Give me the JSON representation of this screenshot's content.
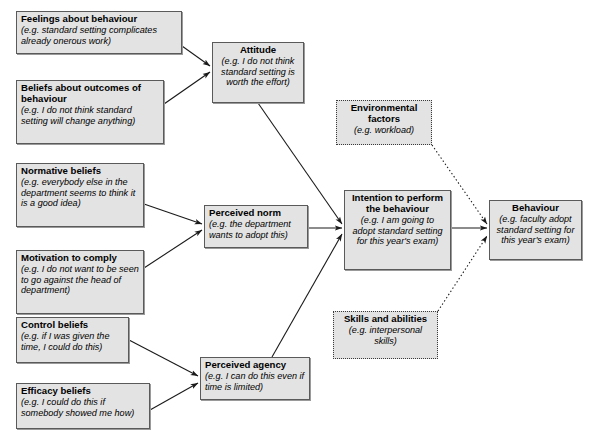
{
  "diagram": {
    "type": "flow-diagram",
    "background_color": "#ffffff",
    "node_fill_color": "#e3e3e3",
    "node_border_color": "#5a5a5a",
    "dotted_border_color": "#3a3a3a",
    "arrow_color": "#1a1a1a"
  },
  "nodes": [
    {
      "id": "feelings",
      "heading": "Feelings about behaviour",
      "example": "(e.g. standard setting complicates already onerous work)",
      "style": "solid",
      "align": "left",
      "x": 16,
      "y": 11,
      "w": 166,
      "h": 43
    },
    {
      "id": "beliefs_outcomes",
      "heading": "Beliefs about outcomes of behaviour",
      "example": "(e.g. I do not think standard setting will change anything)",
      "style": "solid",
      "align": "left",
      "x": 16,
      "y": 80,
      "w": 148,
      "h": 64
    },
    {
      "id": "normative",
      "heading": "Normative beliefs",
      "example": "(e.g. everybody else in the department seems to think it is a good idea)",
      "style": "solid",
      "align": "left",
      "x": 16,
      "y": 163,
      "w": 128,
      "h": 64
    },
    {
      "id": "motivation",
      "heading": "Motivation to comply",
      "example": "(e.g. I do not want to be seen to go against the head of department)",
      "style": "solid",
      "align": "left",
      "x": 16,
      "y": 250,
      "w": 128,
      "h": 64
    },
    {
      "id": "control",
      "heading": "Control beliefs",
      "example": "(e.g. if I was given the time, I could do this)",
      "style": "solid",
      "align": "left",
      "x": 16,
      "y": 317,
      "w": 113,
      "h": 46
    },
    {
      "id": "efficacy",
      "heading": "Efficacy beliefs",
      "example": "(e.g. I could do this if somebody showed me how)",
      "style": "solid",
      "align": "left",
      "x": 16,
      "y": 383,
      "w": 134,
      "h": 46
    },
    {
      "id": "attitude",
      "heading": "Attitude",
      "example": "(e.g. I do not think standard setting is worth the effort)",
      "style": "solid",
      "align": "center",
      "x": 212,
      "y": 42,
      "w": 92,
      "h": 61
    },
    {
      "id": "perceived_norm",
      "heading": "Perceived norm",
      "example": "(e.g. the department wants to adopt this)",
      "style": "solid",
      "align": "left",
      "x": 204,
      "y": 205,
      "w": 104,
      "h": 43
    },
    {
      "id": "perceived_agency",
      "heading": "Perceived agency",
      "example": "(e.g. I can do this even if time is limited)",
      "style": "solid",
      "align": "left",
      "x": 200,
      "y": 357,
      "w": 110,
      "h": 43
    },
    {
      "id": "environmental",
      "heading": "Environmental factors",
      "example": "(e.g. workload)",
      "style": "dotted",
      "align": "center",
      "x": 336,
      "y": 100,
      "w": 96,
      "h": 45
    },
    {
      "id": "skills",
      "heading": "Skills and abilities",
      "example": "(e.g. interpersonal skills)",
      "style": "dotted",
      "align": "center",
      "x": 333,
      "y": 311,
      "w": 105,
      "h": 48
    },
    {
      "id": "intention",
      "heading": "Intention to perform the behaviour",
      "example": "(e.g. I am going to adopt standard setting for this year's exam)",
      "style": "solid",
      "align": "center",
      "x": 344,
      "y": 190,
      "w": 107,
      "h": 80
    },
    {
      "id": "behaviour",
      "heading": "Behaviour",
      "example": "(e.g. faculty adopt standard setting for this year's exam)",
      "style": "solid",
      "align": "center",
      "x": 489,
      "y": 200,
      "w": 93,
      "h": 60
    }
  ],
  "edges": [
    {
      "id": "feelings-attitude",
      "from": "feelings",
      "to": "attitude",
      "style": "solid",
      "x1": 182,
      "y1": 46,
      "x2": 210,
      "y2": 66
    },
    {
      "id": "beliefs-attitude",
      "from": "beliefs_outcomes",
      "to": "attitude",
      "style": "solid",
      "x1": 164,
      "y1": 104,
      "x2": 210,
      "y2": 72
    },
    {
      "id": "normative-norm",
      "from": "normative",
      "to": "perceived_norm",
      "style": "solid",
      "x1": 144,
      "y1": 204,
      "x2": 202,
      "y2": 224
    },
    {
      "id": "motivation-norm",
      "from": "motivation",
      "to": "perceived_norm",
      "style": "solid",
      "x1": 144,
      "y1": 268,
      "x2": 202,
      "y2": 230
    },
    {
      "id": "control-agency",
      "from": "control",
      "to": "perceived_agency",
      "style": "solid",
      "x1": 129,
      "y1": 340,
      "x2": 198,
      "y2": 376
    },
    {
      "id": "efficacy-agency",
      "from": "efficacy",
      "to": "perceived_agency",
      "style": "solid",
      "x1": 150,
      "y1": 410,
      "x2": 198,
      "y2": 383
    },
    {
      "id": "attitude-intention",
      "from": "attitude",
      "to": "intention",
      "style": "solid",
      "x1": 258,
      "y1": 103,
      "x2": 342,
      "y2": 224
    },
    {
      "id": "norm-intention",
      "from": "perceived_norm",
      "to": "intention",
      "style": "solid",
      "x1": 308,
      "y1": 228,
      "x2": 342,
      "y2": 228
    },
    {
      "id": "agency-intention",
      "from": "perceived_agency",
      "to": "intention",
      "style": "solid",
      "x1": 272,
      "y1": 357,
      "x2": 342,
      "y2": 234
    },
    {
      "id": "intention-behaviour",
      "from": "intention",
      "to": "behaviour",
      "style": "solid",
      "x1": 451,
      "y1": 228,
      "x2": 487,
      "y2": 228
    },
    {
      "id": "environmental-behaviour",
      "from": "environmental",
      "to": "behaviour",
      "style": "dotted",
      "x1": 432,
      "y1": 145,
      "x2": 487,
      "y2": 224
    },
    {
      "id": "skills-behaviour",
      "from": "skills",
      "to": "behaviour",
      "style": "dotted",
      "x1": 438,
      "y1": 311,
      "x2": 487,
      "y2": 236
    }
  ]
}
